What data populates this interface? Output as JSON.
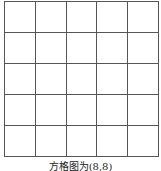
{
  "grid": {
    "rows": 5,
    "cols": 5,
    "line_color": "#555555"
  },
  "caption": "方格图为(8,8)"
}
